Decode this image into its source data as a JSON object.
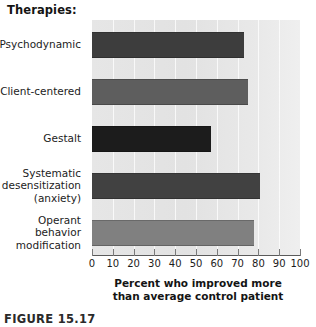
{
  "figure": {
    "legend_title": "Therapies:",
    "caption": "FIGURE 15.17"
  },
  "chart_data": {
    "type": "bar",
    "orientation": "horizontal",
    "title": "Therapies:",
    "xlabel": "Percent who improved more than average control patient",
    "xlabel_line1": "Percent who improved more",
    "xlabel_line2": "than average control patient",
    "ylabel": "",
    "xlim": [
      0,
      100
    ],
    "xticks": [
      0,
      10,
      20,
      30,
      40,
      50,
      60,
      70,
      80,
      90,
      100
    ],
    "xtick_labels": [
      "0",
      "10",
      "20",
      "30",
      "40",
      "50",
      "60",
      "70",
      "80",
      "90",
      "100"
    ],
    "grid": true,
    "legend": "none",
    "plot_background": "#e5e5e5",
    "categories": [
      "Psychodynamic",
      "Client-centered",
      "Gestalt",
      "Systematic\ndesensitization\n(anxiety)",
      "Operant\nbehavior\nmodification"
    ],
    "values": [
      73,
      75,
      57,
      81,
      78
    ],
    "bar_colors": [
      "#3d3d3d",
      "#5e5e5e",
      "#1c1c1c",
      "#414141",
      "#808080"
    ],
    "bars": [
      {
        "label": "Psychodynamic",
        "value": 73,
        "color": "#3d3d3d"
      },
      {
        "label": "Client-centered",
        "value": 75,
        "color": "#5e5e5e"
      },
      {
        "label": "Gestalt",
        "value": 57,
        "color": "#1c1c1c"
      },
      {
        "label": "Systematic\ndesensitization\n(anxiety)",
        "value": 81,
        "color": "#414141"
      },
      {
        "label": "Operant\nbehavior\nmodification",
        "value": 78,
        "color": "#808080"
      }
    ]
  }
}
